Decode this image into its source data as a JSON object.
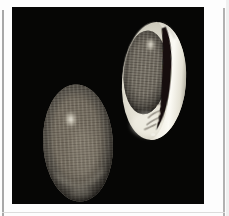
{
  "figure": {
    "name": "two-seashells-photograph",
    "alt": "Photograph of two oval sea shells on a black background: the left shell shows its gray finely-checkered back with a bright highlight; the right shell shows its glossy white aperture side with a dark curved opening and small folds",
    "page_background": "#fdfdfd",
    "rule_color": "#a8a8a8",
    "bottom_rule_color": "#dcdcdc",
    "photo_background": "#060605"
  },
  "colors": {
    "shell_base": "#6e6960",
    "pattern_base": "#7d776c",
    "belly_white": "#e9e6da",
    "lip_white": "#f8f6ee",
    "aperture_dark": "#14100b",
    "highlight": "#f8f6ec",
    "fold_shadow": "#4a443a",
    "rim_light": "#d2cec0"
  }
}
